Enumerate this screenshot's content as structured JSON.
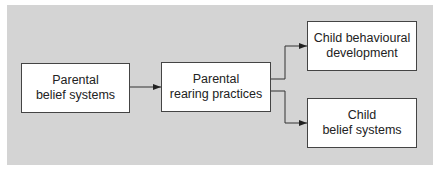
{
  "diagram": {
    "nodes": [
      {
        "id": "parental-belief-systems",
        "line1": "Parental",
        "line2": "belief systems"
      },
      {
        "id": "parental-rearing-practices",
        "line1": "Parental",
        "line2": "rearing practices"
      },
      {
        "id": "child-behavioural-development",
        "line1": "Child behavioural",
        "line2": "development"
      },
      {
        "id": "child-belief-systems",
        "line1": "Child",
        "line2": "belief systems"
      }
    ],
    "edges": [
      {
        "from": "parental-belief-systems",
        "to": "parental-rearing-practices"
      },
      {
        "from": "parental-rearing-practices",
        "to": "child-behavioural-development"
      },
      {
        "from": "parental-rearing-practices",
        "to": "child-belief-systems"
      }
    ],
    "colors": {
      "panel": "#d4d4d4",
      "box": "#ffffff",
      "line": "#333333"
    }
  }
}
